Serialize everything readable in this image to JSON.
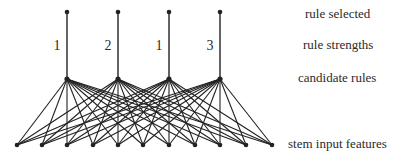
{
  "labels": {
    "rule_selected": "rule selected",
    "rule_strengths": "rule strengths",
    "candidate_rules": "candidate rules",
    "stem_input_features": "stem input features"
  },
  "rules": [
    {
      "strength": "1",
      "x": 67
    },
    {
      "strength": "2",
      "x": 118
    },
    {
      "strength": "1",
      "x": 169
    },
    {
      "strength": "3",
      "x": 220
    }
  ],
  "inputs_x": [
    17,
    42,
    67,
    93,
    118,
    143,
    169,
    195,
    220,
    246,
    272
  ],
  "levels_y": {
    "selected": 12,
    "candidate": 79,
    "inputs": 145
  },
  "colors": {
    "line": "#222222",
    "node": "#222222",
    "text": "#2a2a2a"
  }
}
